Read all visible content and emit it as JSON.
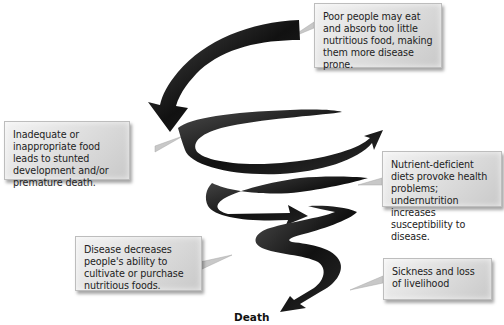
{
  "diagram": {
    "type": "downward spiral",
    "terminal_label": "Death",
    "callouts": [
      {
        "id": "poor-people",
        "text": "Poor people may eat and absorb too little nutritious food, making them more disease prone."
      },
      {
        "id": "inadequate-food",
        "text": "Inadequate or inappropriate food leads to stunted development and/or premature death."
      },
      {
        "id": "nutrient-deficient",
        "text": "Nutrient-deficient diets provoke health problems; undernutrition increases susceptibility to disease."
      },
      {
        "id": "disease-decreases",
        "text": "Disease decreases people's ability to cultivate or purchase nutritious foods."
      },
      {
        "id": "sickness-loss",
        "text": "Sickness and loss of livelihood"
      }
    ]
  },
  "colors": {
    "arrow": "#1a1a1a",
    "box_light": "#f3f3f3",
    "box_dark": "#c9c9c9",
    "connector": "#c0c0c0"
  }
}
